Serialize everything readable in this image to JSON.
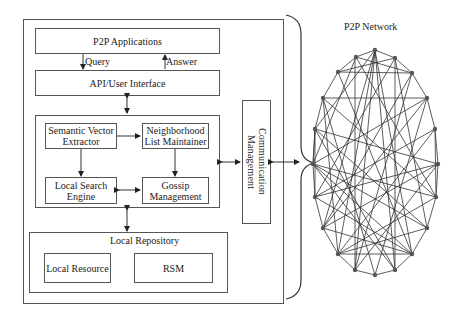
{
  "node_architecture": {
    "p2p_applications": "P2P Applications",
    "query_label": "Query",
    "answer_label": "Answer",
    "api_user_interface": "API/User Interface",
    "semantic_vector_extractor": "Semantic Vector Extractor",
    "semantic_vector_extractor_lines": [
      "Semantic Vector",
      "Extractor"
    ],
    "neighborhood_list_maintainer_lines": [
      "Neighborhood",
      "List Maintainer"
    ],
    "local_search_engine_lines": [
      "Local Search",
      "Engine"
    ],
    "gossip_management_lines": [
      "Gossip",
      "Management"
    ],
    "local_repository": "Local Repository",
    "local_resource": "Local Resource",
    "rsm": "RSM",
    "communication_management": "Communication Management"
  },
  "network": {
    "title": "P2P Network",
    "node_count": 20,
    "colors": {
      "edge": "#333333",
      "node": "#555555"
    }
  }
}
